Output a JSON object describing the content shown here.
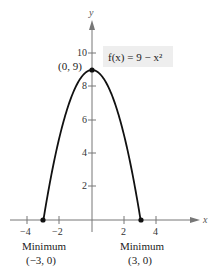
{
  "chart_data": {
    "type": "line",
    "title": "",
    "function_label": "f(x) = 9 − x²",
    "xlabel": "x",
    "ylabel": "y",
    "xlim": [
      -5,
      5
    ],
    "ylim": [
      0,
      12
    ],
    "grid": false,
    "x_ticks": [
      -4,
      -2,
      2,
      4
    ],
    "x_tick_labels": [
      "−4",
      "−2",
      "2",
      "4"
    ],
    "y_ticks": [
      2,
      4,
      6,
      8,
      10
    ],
    "y_tick_labels": [
      "2",
      "4",
      "6",
      "8",
      "10"
    ],
    "series": [
      {
        "name": "f(x) = 9 − x²",
        "x": [
          -3,
          -2.5,
          -2,
          -1.5,
          -1,
          -0.5,
          0,
          0.5,
          1,
          1.5,
          2,
          2.5,
          3
        ],
        "y": [
          0,
          2.75,
          5,
          6.75,
          8,
          8.75,
          9,
          8.75,
          8,
          6.75,
          5,
          2.75,
          0
        ]
      }
    ],
    "points": [
      {
        "x": 0,
        "y": 9,
        "label": "(0, 9)"
      },
      {
        "x": -3,
        "y": 0,
        "label": "(−3, 0)",
        "caption": "Minimum"
      },
      {
        "x": 3,
        "y": 0,
        "label": "(3, 0)",
        "caption": "Minimum"
      }
    ]
  },
  "labels": {
    "y_axis": "y",
    "x_axis": "x",
    "function": "f(x) = 9 − x²",
    "vertex": "(0, 9)",
    "min_left_title": "Minimum",
    "min_left_coords": "(−3, 0)",
    "min_right_title": "Minimum",
    "min_right_coords": "(3, 0)",
    "xt0": "−4",
    "xt1": "−2",
    "xt2": "2",
    "xt3": "4",
    "yt0": "2",
    "yt1": "4",
    "yt2": "6",
    "yt3": "8",
    "yt4": "10"
  }
}
